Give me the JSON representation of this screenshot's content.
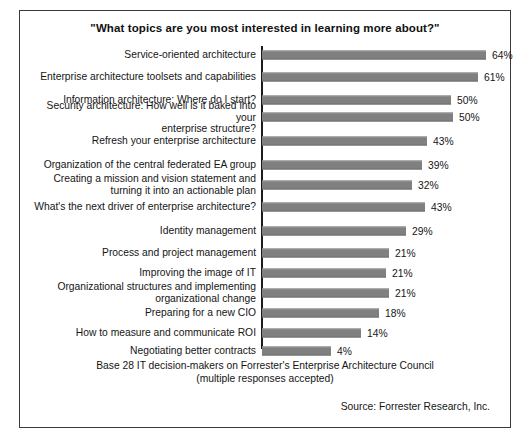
{
  "figure": {
    "title": "\"What topics are you most interested in learning more about?\"",
    "base_note": "Base 28 IT decision-makers on Forrester's Enterprise Architecture Council\n(multiple responses accepted)",
    "source_note": "Source: Forrester Research, Inc.",
    "caption": "",
    "bar_color": "#808080",
    "axis_color": "#1b1b1b",
    "border_color": "#3a3a3a"
  },
  "chart_data": {
    "type": "bar",
    "orientation": "horizontal",
    "title": "\"What topics are you most interested in learning more about?\"",
    "xlabel": "",
    "ylabel": "",
    "grid": false,
    "legend": null,
    "value_suffix": "%",
    "categories": [
      "Service-oriented architecture",
      "Enterprise architecture toolsets and capabilities",
      "Information architecture: Where do I start?",
      "Security architecture: How well is it baked into your\nenterprise structure?",
      "Refresh your enterprise architecture",
      "Organization of the central federated EA group",
      "Creating a mission and vision statement and\nturning it into an actionable plan",
      "What's the next driver of enterprise architecture?",
      "Identity management",
      "Process and project management",
      "Improving the image of IT",
      "Organizational structures and implementing\norganizational change",
      "Preparing for a new CIO",
      "How to measure and communicate ROI",
      "Negotiating better contracts"
    ],
    "values": [
      64,
      61,
      50,
      50,
      43,
      39,
      32,
      43,
      29,
      21,
      21,
      21,
      18,
      14,
      4
    ],
    "value_labels": [
      "64%",
      "61%",
      "50%",
      "50%",
      "43%",
      "39%",
      "32%",
      "43%",
      "29%",
      "21%",
      "21%",
      "21%",
      "18%",
      "14%",
      "4%"
    ],
    "bar_pixel_widths": [
      224,
      216,
      189,
      191,
      165,
      160,
      150,
      163,
      144,
      127,
      124,
      127,
      117,
      99,
      69
    ],
    "row_tops": [
      0,
      22,
      45,
      62,
      86,
      110,
      130,
      152,
      176,
      198,
      218,
      238,
      258,
      278,
      296
    ]
  }
}
